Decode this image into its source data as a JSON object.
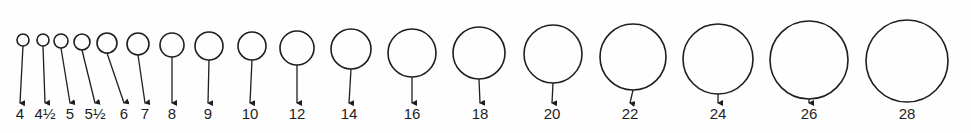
{
  "diagram": {
    "stroke_color": "#1e1e1e",
    "background_color": "#fefefe",
    "label_top": 106,
    "arrow_tip_y": 103,
    "sizes": [
      {
        "label": "4",
        "cx": 23,
        "cy": 40,
        "r": 6,
        "label_x": 20
      },
      {
        "label": "4½",
        "cx": 43,
        "cy": 40,
        "r": 6,
        "label_x": 45
      },
      {
        "label": "5",
        "cx": 61,
        "cy": 41,
        "r": 7,
        "label_x": 70
      },
      {
        "label": "5½",
        "cx": 82,
        "cy": 42,
        "r": 8,
        "label_x": 95
      },
      {
        "label": "6",
        "cx": 107,
        "cy": 43,
        "r": 10,
        "label_x": 124
      },
      {
        "label": "7",
        "cx": 138,
        "cy": 44,
        "r": 11,
        "label_x": 145
      },
      {
        "label": "8",
        "cx": 172,
        "cy": 45,
        "r": 12,
        "label_x": 172
      },
      {
        "label": "9",
        "cx": 209,
        "cy": 46,
        "r": 14,
        "label_x": 208
      },
      {
        "label": "10",
        "cx": 252,
        "cy": 46,
        "r": 14,
        "label_x": 250
      },
      {
        "label": "12",
        "cx": 297,
        "cy": 48,
        "r": 17,
        "label_x": 297
      },
      {
        "label": "14",
        "cx": 351,
        "cy": 49,
        "r": 20,
        "label_x": 349
      },
      {
        "label": "16",
        "cx": 412,
        "cy": 53,
        "r": 24,
        "label_x": 412
      },
      {
        "label": "18",
        "cx": 479,
        "cy": 53,
        "r": 26,
        "label_x": 480
      },
      {
        "label": "20",
        "cx": 553,
        "cy": 54,
        "r": 29,
        "label_x": 552
      },
      {
        "label": "22",
        "cx": 633,
        "cy": 57,
        "r": 33,
        "label_x": 630
      },
      {
        "label": "24",
        "cx": 718,
        "cy": 59,
        "r": 35,
        "label_x": 718
      },
      {
        "label": "26",
        "cx": 809,
        "cy": 60,
        "r": 39,
        "label_x": 809
      },
      {
        "label": "28",
        "cx": 907,
        "cy": 61,
        "r": 41,
        "label_x": 907
      }
    ]
  }
}
